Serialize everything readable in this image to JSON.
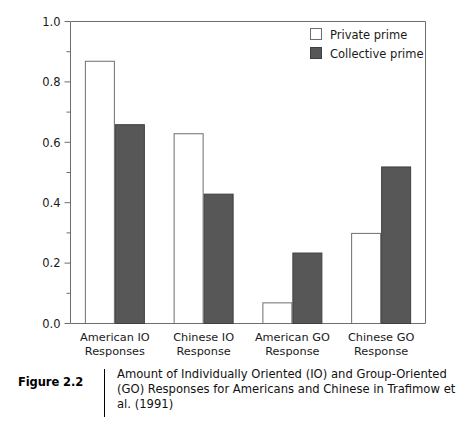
{
  "figure": {
    "number_label": "Figure 2.2",
    "caption": "Amount of Individually Oriented (IO) and Group-Oriented (GO) Responses for Americans and Chinese in Trafimow et al. (1991)"
  },
  "colors": {
    "private_prime_fill": "#ffffff",
    "private_prime_stroke": "#6e6e6e",
    "collective_prime_fill": "#575757",
    "collective_prime_stroke": "#3f3f3f",
    "axis": "#6e6e6e",
    "text": "#1a1a1a"
  },
  "axis": {
    "y_ticks": [
      "0.0",
      "0.2",
      "0.4",
      "0.6",
      "0.8",
      "1.0"
    ],
    "y_minor_ticks": [
      "0.1",
      "0.3",
      "0.5",
      "0.7",
      "0.9"
    ],
    "y_min": 0.0,
    "y_max": 1.0
  },
  "legend": {
    "entries": [
      {
        "label": "Private prime",
        "swatch": "private-prime-swatch"
      },
      {
        "label": "Collective prime",
        "swatch": "collective-prime-swatch"
      }
    ]
  },
  "chart_data": {
    "type": "bar",
    "title": "",
    "xlabel": "",
    "ylabel": "",
    "ylim": [
      0.0,
      1.0
    ],
    "grid": false,
    "legend_position": "top-right",
    "categories": [
      "American IO\nResponses",
      "Chinese IO\nResponse",
      "American GO\nResponse",
      "Chinese GO\nResponse"
    ],
    "category_lines": [
      [
        "American IO",
        "Responses"
      ],
      [
        "Chinese IO",
        "Response"
      ],
      [
        "American GO",
        "Response"
      ],
      [
        "Chinese GO",
        "Response"
      ]
    ],
    "series": [
      {
        "name": "Private prime",
        "values": [
          0.87,
          0.63,
          0.07,
          0.3
        ]
      },
      {
        "name": "Collective prime",
        "values": [
          0.66,
          0.43,
          0.235,
          0.52
        ]
      }
    ]
  }
}
